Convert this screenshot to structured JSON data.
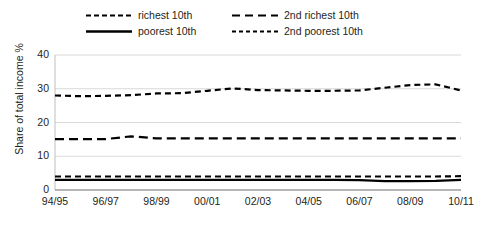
{
  "chart_data": {
    "type": "line",
    "title": "",
    "xlabel": "",
    "ylabel": "Share of total income %",
    "ylim": [
      0,
      40
    ],
    "yticks": [
      0,
      10,
      20,
      30,
      40
    ],
    "grid": true,
    "legend_position": "top",
    "x": [
      "94/95",
      "95/96",
      "96/97",
      "97/98",
      "98/99",
      "99/00",
      "00/01",
      "01/02",
      "02/03",
      "03/04",
      "04/05",
      "05/06",
      "06/07",
      "07/08",
      "08/09",
      "09/10",
      "10/11"
    ],
    "xticks": [
      "94/95",
      "96/97",
      "98/99",
      "00/01",
      "02/03",
      "04/05",
      "06/07",
      "08/09",
      "10/11"
    ],
    "series": [
      {
        "name": "richest 10th",
        "style": "dashed",
        "color": "#000000",
        "values": [
          28.0,
          27.8,
          27.9,
          28.1,
          28.6,
          28.7,
          29.4,
          30.1,
          29.6,
          29.5,
          29.4,
          29.4,
          29.5,
          30.3,
          31.1,
          31.3,
          29.5
        ]
      },
      {
        "name": "2nd richest 10th",
        "style": "long-dashed",
        "color": "#000000",
        "values": [
          15.1,
          15.1,
          15.1,
          15.9,
          15.3,
          15.3,
          15.3,
          15.3,
          15.3,
          15.3,
          15.3,
          15.3,
          15.3,
          15.3,
          15.3,
          15.3,
          15.3
        ]
      },
      {
        "name": "2nd poorest 10th",
        "style": "dashed",
        "color": "#000000",
        "values": [
          4.0,
          4.0,
          4.0,
          4.0,
          4.0,
          4.0,
          4.0,
          4.0,
          4.0,
          4.0,
          4.0,
          4.0,
          4.0,
          4.0,
          4.0,
          4.0,
          4.1
        ]
      },
      {
        "name": "poorest 10th",
        "style": "solid",
        "color": "#000000",
        "values": [
          3.0,
          3.0,
          3.0,
          3.0,
          3.0,
          3.0,
          3.0,
          3.0,
          3.0,
          3.0,
          3.0,
          3.0,
          2.9,
          2.6,
          2.6,
          2.7,
          3.0
        ]
      }
    ],
    "legend": [
      {
        "name": "richest 10th",
        "style": "dashed",
        "column": 1,
        "row": 1
      },
      {
        "name": "2nd richest 10th",
        "style": "long-dashed",
        "column": 2,
        "row": 1
      },
      {
        "name": "poorest 10th",
        "style": "solid",
        "column": 1,
        "row": 2
      },
      {
        "name": "2nd poorest 10th",
        "style": "dashed",
        "column": 2,
        "row": 2
      }
    ]
  }
}
